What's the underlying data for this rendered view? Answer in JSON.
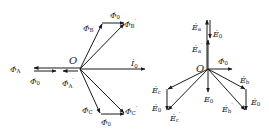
{
  "diagram": {
    "type": "phasor-diagram",
    "left_panel": {
      "origin_label": "O",
      "current": {
        "symbol": "İ",
        "sub": "0"
      },
      "labels": [
        {
          "id": "phiB",
          "symbol": "Φ̇",
          "sub": "B",
          "prime": ""
        },
        {
          "id": "phi0_top",
          "symbol": "Φ̇",
          "sub": "0",
          "prime": ""
        },
        {
          "id": "phiB_p",
          "symbol": "Φ̇",
          "sub": "B",
          "prime": "′"
        },
        {
          "id": "phiA",
          "symbol": "Φ̇",
          "sub": "A",
          "prime": ""
        },
        {
          "id": "phi0_mid",
          "symbol": "Φ̇",
          "sub": "0",
          "prime": ""
        },
        {
          "id": "phiA_p",
          "symbol": "Φ̇",
          "sub": "A",
          "prime": "′"
        },
        {
          "id": "phiC",
          "symbol": "Φ̇",
          "sub": "C",
          "prime": ""
        },
        {
          "id": "phi0_bot",
          "symbol": "Φ̇",
          "sub": "0",
          "prime": ""
        },
        {
          "id": "phiC_p",
          "symbol": "Φ̇",
          "sub": "C",
          "prime": "′"
        }
      ]
    },
    "right_panel": {
      "origin_label": "O",
      "labels": [
        {
          "id": "Ea",
          "symbol": "Ė",
          "sub": "a",
          "prime": ""
        },
        {
          "id": "E0_top",
          "symbol": "Ė",
          "sub": "0",
          "prime": ""
        },
        {
          "id": "Ea_p",
          "symbol": "Ė",
          "sub": "a",
          "prime": "′"
        },
        {
          "id": "phi0",
          "symbol": "Φ̇",
          "sub": "0",
          "prime": ""
        },
        {
          "id": "Eb",
          "symbol": "Ė",
          "sub": "b",
          "prime": ""
        },
        {
          "id": "E0_right",
          "symbol": "Ė",
          "sub": "0",
          "prime": ""
        },
        {
          "id": "Eb_p",
          "symbol": "Ė",
          "sub": "b",
          "prime": "′"
        },
        {
          "id": "E0_mid",
          "symbol": "E",
          "sub": "0",
          "prime": ""
        },
        {
          "id": "Ec",
          "symbol": "Ė",
          "sub": "c",
          "prime": ""
        },
        {
          "id": "E0_left",
          "symbol": "Ė",
          "sub": "0",
          "prime": ""
        },
        {
          "id": "Ec_p",
          "symbol": "Ė",
          "sub": "c",
          "prime": "′"
        }
      ]
    },
    "colors": {
      "stroke": "#1a1a1a",
      "background": "#ffffff"
    }
  }
}
